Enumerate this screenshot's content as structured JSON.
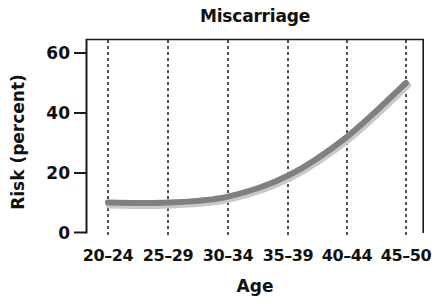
{
  "chart_data": {
    "type": "line",
    "title": "Miscarriage",
    "xlabel": "Age",
    "ylabel": "Risk (percent)",
    "categories": [
      "20–24",
      "25–29",
      "30–34",
      "35–39",
      "40–44",
      "45–50"
    ],
    "values": [
      10,
      10,
      12,
      19,
      32,
      50
    ],
    "series": [
      {
        "name": "Miscarriage risk",
        "values": [
          10,
          10,
          12,
          19,
          32,
          50
        ]
      }
    ],
    "ylim": [
      0,
      65
    ],
    "yticks": [
      0,
      20,
      40,
      60
    ],
    "ytick_labels": [
      "0",
      "20",
      "40",
      "60"
    ],
    "xtick_labels": [
      "20–24",
      "25–29",
      "30–34",
      "35–39",
      "40–44",
      "45–50"
    ],
    "grid": "vertical-dashed",
    "legend": "none",
    "line_color": "#808080",
    "shadow_color": "#c9c9c9",
    "axis_color": "#1a1a1a",
    "grid_color": "#1a1a1a",
    "background": "#ffffff"
  }
}
